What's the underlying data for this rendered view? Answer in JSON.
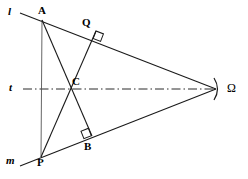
{
  "figure": {
    "kind": "hyperbolic-geometry-diagram",
    "width": 248,
    "height": 179,
    "background_color": "#ffffff",
    "stroke_color": "#000000"
  },
  "points": {
    "A": {
      "label": "A",
      "x": 42,
      "y": 20,
      "label_x": 38,
      "label_y": 5
    },
    "Q": {
      "label": "Q",
      "x": 96,
      "y": 31,
      "label_x": 82,
      "label_y": 17
    },
    "C": {
      "label": "C",
      "x": 67,
      "y": 88,
      "label_x": 72,
      "label_y": 76
    },
    "B": {
      "label": "B",
      "x": 92,
      "y": 136,
      "label_x": 84,
      "label_y": 141
    },
    "P": {
      "label": "P",
      "x": 41,
      "y": 157,
      "label_x": 37,
      "label_y": 157
    },
    "Omega": {
      "label": "Ω",
      "x": 216,
      "y": 89,
      "label_x": 227,
      "label_y": 82
    }
  },
  "lines": {
    "l": {
      "label": "l",
      "label_x": 8,
      "label_y": 6,
      "from": "A",
      "to": "Omega",
      "style": "solid"
    },
    "m": {
      "label": "m",
      "label_x": 6,
      "label_y": 155,
      "from": "P",
      "to": "Omega",
      "style": "solid"
    },
    "t": {
      "label": "t",
      "label_x": 9,
      "label_y": 82,
      "from": "left-edge",
      "to": "Omega",
      "style": "dash-dot"
    },
    "AP": {
      "label": "",
      "from": "A",
      "to": "P",
      "style": "solid-thin"
    },
    "AB": {
      "label": "",
      "from": "A",
      "to": "B",
      "style": "solid"
    },
    "PQ": {
      "label": "",
      "from": "P",
      "to": "Q",
      "style": "solid"
    }
  },
  "right_angles": [
    {
      "at": "Q",
      "on_line": "l",
      "marker": "square"
    },
    {
      "at": "B",
      "on_line": "m",
      "marker": "square"
    }
  ],
  "ideal_point_marker": {
    "glyph": ")",
    "x": 219,
    "y": 89,
    "description": "ideal-point-bracket"
  }
}
